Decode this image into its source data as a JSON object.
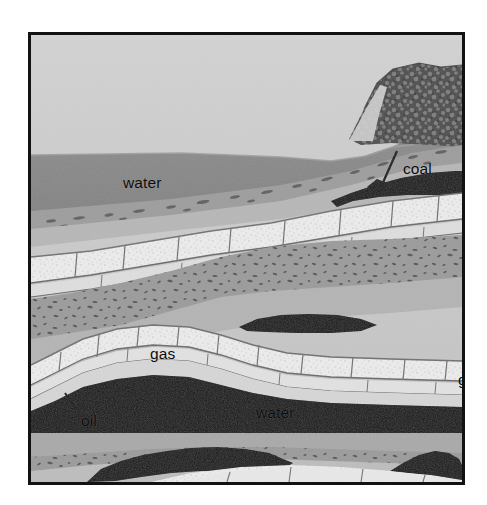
{
  "figure": {
    "caption": "",
    "frame": {
      "border_color": "#121212",
      "background_color": "#c8c8c8"
    }
  },
  "labels": [
    {
      "id": "water-top",
      "text": "water",
      "x": 92,
      "y": 140,
      "leader": false
    },
    {
      "id": "coal",
      "text": "coal",
      "x": 372,
      "y": 126,
      "leader": true
    },
    {
      "id": "gas-left",
      "text": "gas",
      "x": 119,
      "y": 311,
      "leader": false
    },
    {
      "id": "gas-right",
      "text": "gas",
      "x": 427,
      "y": 337,
      "leader": false
    },
    {
      "id": "oil",
      "text": "oil",
      "x": 50,
      "y": 378,
      "leader": true
    },
    {
      "id": "water-mid",
      "text": "water",
      "x": 225,
      "y": 370,
      "leader": false
    }
  ],
  "label_text": {
    "water_top": "water",
    "coal": "coal",
    "gas_left": "gas",
    "gas_right": "gas",
    "oil": "oil",
    "water_mid": "water"
  },
  "palette": {
    "page_background": "#ffffff",
    "frame_border": "#121212",
    "sky": "#c9c9c9",
    "water": "#898989",
    "rock_light": "#b4b4b4",
    "rock_mid": "#a3a3a3",
    "limestone_white": "#ececec",
    "limestone_shadow": "#9a9a9a",
    "conglomerate": "#9b9b9b",
    "conglomerate_speck": "#4a4a4a",
    "coal_black": "#111111",
    "hill_dark": "#5a5a5a",
    "joint_line": "#6d6d6d"
  },
  "strata": [
    {
      "name": "sky",
      "material": "air",
      "color": "#c9c9c9"
    },
    {
      "name": "water-body-upper",
      "material": "water",
      "color": "#898989",
      "label": "water"
    },
    {
      "name": "vegetated-hill",
      "material": "coal-outcrop",
      "color": "#5a5a5a"
    },
    {
      "name": "shale-bed-upper",
      "material": "shale",
      "color": "#9e9e9e"
    },
    {
      "name": "coal-seam-upper",
      "material": "coal",
      "color": "#111111",
      "label": "coal"
    },
    {
      "name": "limestone-bed-upper",
      "material": "limestone",
      "color": "#ececec"
    },
    {
      "name": "sandstone-bed",
      "material": "sandstone",
      "color": "#b4b4b4"
    },
    {
      "name": "conglomerate-bed",
      "material": "conglomerate",
      "color": "#9b9b9b"
    },
    {
      "name": "sandstone-bed-2",
      "material": "sandstone",
      "color": "#b4b4b4"
    },
    {
      "name": "limestone-anticline",
      "material": "limestone",
      "color": "#ececec"
    },
    {
      "name": "coal-lens-middle",
      "material": "coal",
      "color": "#111111"
    },
    {
      "name": "gas-cap",
      "material": "natural gas",
      "color": "#d8d8d8",
      "label": "gas"
    },
    {
      "name": "oil-reservoir",
      "material": "oil",
      "color": "#111111",
      "label": "oil"
    },
    {
      "name": "water-body-lower",
      "material": "water",
      "color": "#a8a8a8",
      "label": "water"
    },
    {
      "name": "conglomerate-bed-2",
      "material": "conglomerate",
      "color": "#9b9b9b"
    },
    {
      "name": "sandstone-bed-3",
      "material": "sandstone",
      "color": "#bcbcbc"
    },
    {
      "name": "coal-lens-lower",
      "material": "coal",
      "color": "#111111"
    },
    {
      "name": "limestone-bed-lower",
      "material": "limestone",
      "color": "#ececec"
    }
  ]
}
